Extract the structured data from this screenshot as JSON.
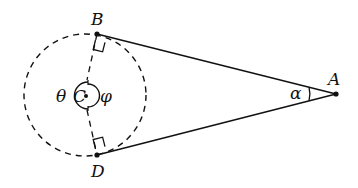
{
  "diagram": {
    "points": {
      "A": {
        "label": "A",
        "x": 336,
        "y": 94
      },
      "B": {
        "label": "B",
        "x": 97,
        "y": 34
      },
      "C": {
        "label": "C",
        "x": 86,
        "y": 95
      },
      "D": {
        "label": "D",
        "x": 97,
        "y": 155
      }
    },
    "circle": {
      "cx": 85,
      "cy": 95,
      "r": 61,
      "style": "dashed"
    },
    "angles": {
      "theta": "θ",
      "phi": "φ",
      "alpha": "α"
    },
    "line_color": "#111111"
  }
}
